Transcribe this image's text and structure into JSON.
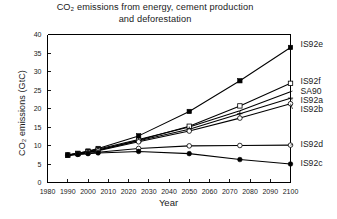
{
  "chart_data": {
    "type": "line",
    "title_line1": "CO₂ emissions from energy, cement production",
    "title_line2": "and deforestation",
    "xlabel": "Year",
    "ylabel": "CO₂ emissions (GtC)",
    "xlim": [
      1980,
      2100
    ],
    "ylim": [
      0,
      40
    ],
    "xticks": [
      1980,
      1990,
      2000,
      2010,
      2020,
      2030,
      2040,
      2050,
      2060,
      2070,
      2080,
      2090,
      2100
    ],
    "yticks": [
      0,
      5,
      10,
      15,
      20,
      25,
      30,
      35,
      40
    ],
    "grid": false,
    "legend_position": "right-inline-labels",
    "series": [
      {
        "name": "IS92e",
        "marker": "filled-square",
        "x": [
          1990,
          1995,
          2000,
          2005,
          2025,
          2050,
          2075,
          2100
        ],
        "values": [
          7.4,
          7.9,
          8.5,
          9.2,
          12.6,
          19.2,
          27.5,
          36.5
        ]
      },
      {
        "name": "IS92f",
        "marker": "open-square",
        "x": [
          1990,
          1995,
          2000,
          2005,
          2025,
          2050,
          2075,
          2100
        ],
        "values": [
          7.4,
          7.8,
          8.3,
          8.8,
          11.4,
          15.2,
          20.7,
          26.8
        ]
      },
      {
        "name": "SA90",
        "marker": "none",
        "x": [
          1990,
          2000,
          2025,
          2050,
          2075,
          2100
        ],
        "values": [
          7.4,
          8.4,
          11.6,
          15.0,
          19.4,
          24.5
        ]
      },
      {
        "name": "IS92a",
        "marker": "cross",
        "x": [
          1990,
          1995,
          2000,
          2005,
          2025,
          2050,
          2075,
          2100
        ],
        "values": [
          7.4,
          7.8,
          8.2,
          8.7,
          11.3,
          14.4,
          18.6,
          22.8
        ]
      },
      {
        "name": "IS92b",
        "marker": "open-circle",
        "x": [
          1990,
          1995,
          2000,
          2005,
          2025,
          2050,
          2075,
          2100
        ],
        "values": [
          7.4,
          7.7,
          8.1,
          8.6,
          11.0,
          13.9,
          17.4,
          21.3
        ]
      },
      {
        "name": "IS92d",
        "marker": "open-circle",
        "x": [
          1990,
          1995,
          2000,
          2005,
          2025,
          2050,
          2075,
          2100
        ],
        "values": [
          7.4,
          7.6,
          7.9,
          8.2,
          9.2,
          9.9,
          10.0,
          10.1
        ]
      },
      {
        "name": "IS92c",
        "marker": "filled-circle",
        "x": [
          1990,
          1995,
          2000,
          2005,
          2025,
          2050,
          2075,
          2100
        ],
        "values": [
          7.4,
          7.6,
          7.8,
          8.0,
          8.4,
          7.8,
          6.2,
          5.0
        ]
      }
    ]
  },
  "axes": {
    "x_tick_labels": [
      "1980",
      "1990",
      "2000",
      "2010",
      "2020",
      "2030",
      "2040",
      "2050",
      "2060",
      "2070",
      "2080",
      "2090",
      "2100"
    ],
    "y_tick_labels": [
      "0",
      "5",
      "10",
      "15",
      "20",
      "25",
      "30",
      "35",
      "40"
    ]
  },
  "series_labels": [
    {
      "text": "IS92e",
      "y_value": 36.5
    },
    {
      "text": "IS92f",
      "y_value": 26.8
    },
    {
      "text": "SA90",
      "y_value": 24.5
    },
    {
      "text": "IS92a",
      "y_value": 22.8
    },
    {
      "text": "IS92b",
      "y_value": 21.3
    },
    {
      "text": "IS92d",
      "y_value": 10.1
    },
    {
      "text": "IS92c",
      "y_value": 5.0
    }
  ]
}
